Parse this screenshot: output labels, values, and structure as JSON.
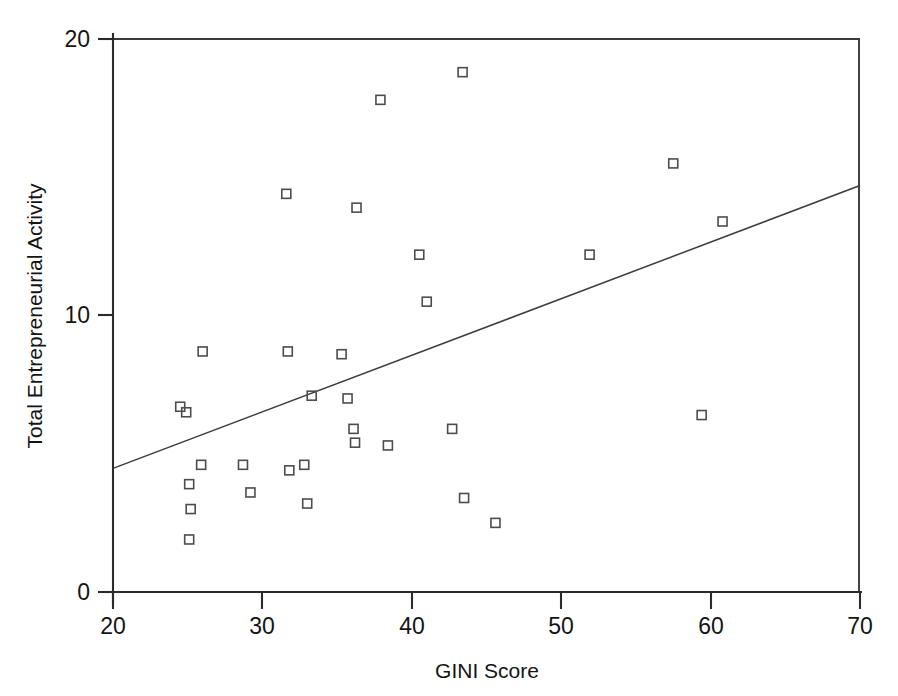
{
  "chart_data": {
    "type": "scatter",
    "title": "",
    "xlabel": "GINI Score",
    "ylabel": "Total Entrepreneurial Activity",
    "xlim": [
      20,
      70
    ],
    "ylim": [
      0,
      20
    ],
    "xticks": [
      20,
      30,
      40,
      50,
      60,
      70
    ],
    "yticks": [
      0,
      10,
      20
    ],
    "xtick_labels": [
      "20",
      "30",
      "40",
      "50",
      "60",
      "70"
    ],
    "ytick_labels": [
      "0",
      "10",
      "20"
    ],
    "grid": false,
    "legend": false,
    "marker_style": "open-square",
    "marker_color": "#4d4d4d",
    "line_color": "#3d3d3d",
    "axis_color": "#2a2a2a",
    "background": "#ffffff",
    "points": [
      {
        "x": 24.5,
        "y": 6.7
      },
      {
        "x": 24.9,
        "y": 6.5
      },
      {
        "x": 25.1,
        "y": 3.9
      },
      {
        "x": 25.2,
        "y": 3.0
      },
      {
        "x": 25.1,
        "y": 1.9
      },
      {
        "x": 25.9,
        "y": 4.6
      },
      {
        "x": 26.0,
        "y": 8.7
      },
      {
        "x": 28.7,
        "y": 4.6
      },
      {
        "x": 29.2,
        "y": 3.6
      },
      {
        "x": 31.7,
        "y": 8.7
      },
      {
        "x": 31.6,
        "y": 14.4
      },
      {
        "x": 31.8,
        "y": 4.4
      },
      {
        "x": 32.8,
        "y": 4.6
      },
      {
        "x": 33.0,
        "y": 3.2
      },
      {
        "x": 33.3,
        "y": 7.1
      },
      {
        "x": 35.3,
        "y": 8.6
      },
      {
        "x": 35.7,
        "y": 7.0
      },
      {
        "x": 36.1,
        "y": 5.9
      },
      {
        "x": 36.2,
        "y": 5.4
      },
      {
        "x": 36.3,
        "y": 13.9
      },
      {
        "x": 37.9,
        "y": 17.8
      },
      {
        "x": 38.4,
        "y": 5.3
      },
      {
        "x": 40.5,
        "y": 12.2
      },
      {
        "x": 41.0,
        "y": 10.5
      },
      {
        "x": 42.7,
        "y": 5.9
      },
      {
        "x": 43.4,
        "y": 18.8
      },
      {
        "x": 43.5,
        "y": 3.4
      },
      {
        "x": 45.6,
        "y": 2.5
      },
      {
        "x": 51.9,
        "y": 12.2
      },
      {
        "x": 57.5,
        "y": 15.5
      },
      {
        "x": 59.4,
        "y": 6.4
      },
      {
        "x": 60.8,
        "y": 13.4
      }
    ],
    "trend_line": {
      "x0": 20,
      "y0": 4.47,
      "x1": 70,
      "y1": 14.7
    }
  }
}
